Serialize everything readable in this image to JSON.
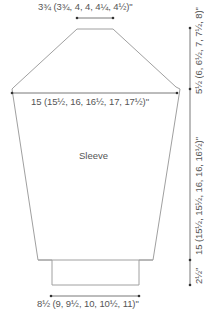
{
  "diagram": {
    "piece_label": "Sleeve",
    "dimensions": {
      "top_width": "3¾ (3¾, 4, 4, 4¼, 4½)\"",
      "upper_width": "15 (15½, 16, 16½, 17, 17½)\"",
      "cuff_width": "8½ (9, 9½, 10, 10½, 11)\"",
      "cap_height": "5½ (6, 6½, 7, 7½, 8)\"",
      "sleeve_length": "15 (15½, 15½, 16, 16, 16½)\"",
      "cuff_height": "2½\""
    },
    "colors": {
      "outline": "#9a9a9a",
      "dimension_line": "#555555",
      "text": "#555555"
    }
  }
}
